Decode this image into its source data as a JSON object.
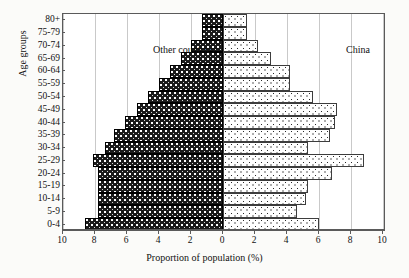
{
  "chart_data": {
    "type": "bar",
    "subtype": "population-pyramid",
    "title": "",
    "xlabel": "Proportion of population (%)",
    "ylabel": "Age groups",
    "grid": true,
    "legend_position": "in-plot",
    "categories": [
      "0-4",
      "5-9",
      "10-14",
      "15-19",
      "20-24",
      "25-29",
      "30-34",
      "35-39",
      "40-44",
      "45-49",
      "50-54",
      "55-59",
      "60-64",
      "65-69",
      "70-74",
      "75-79",
      "80+"
    ],
    "axis_ticks_left": [
      10,
      8,
      6,
      4,
      2,
      0
    ],
    "axis_ticks_right": [
      0,
      2,
      4,
      6,
      8,
      10
    ],
    "xlim_left": [
      0,
      10
    ],
    "xlim_right": [
      0,
      10
    ],
    "series": [
      {
        "name": "Other countries",
        "side": "left",
        "fill": "dark-dotted",
        "values": [
          8.6,
          7.8,
          7.8,
          7.8,
          7.8,
          8.1,
          7.4,
          6.8,
          6.1,
          5.4,
          4.7,
          4.0,
          3.3,
          2.6,
          2.0,
          1.3,
          1.3
        ]
      },
      {
        "name": "China",
        "side": "right",
        "fill": "light-dotted",
        "values": [
          6.0,
          4.6,
          5.2,
          5.3,
          6.8,
          8.8,
          5.3,
          6.7,
          7.0,
          7.1,
          5.6,
          4.2,
          4.2,
          3.0,
          2.2,
          1.5,
          1.5
        ]
      }
    ]
  },
  "labels": {
    "series_left": "Other countries",
    "series_right": "China",
    "y_axis_title": "Age groups",
    "x_axis_title": "Proportion of population (%)"
  },
  "colors": {
    "frame": "#5a5a5a",
    "grid": "#c9c9c9",
    "bar_left_fill": "#1b1b1b",
    "bar_right_fill": "#ffffff",
    "bar_right_stroke": "#3d3d3d",
    "background": "#fbfbf9",
    "text": "#111111"
  }
}
